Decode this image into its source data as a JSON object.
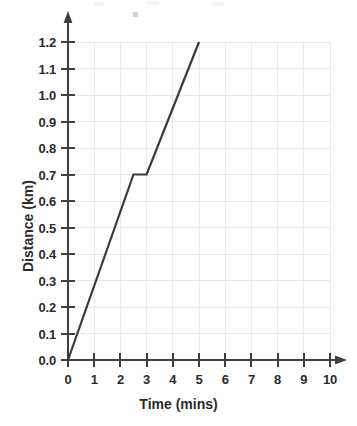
{
  "chart_data": {
    "type": "line",
    "title": "",
    "subtitle": "",
    "xlabel": "Time (mins)",
    "ylabel": "Distance (km)",
    "xlim": [
      0,
      10
    ],
    "ylim": [
      0.0,
      1.2
    ],
    "grid": true,
    "legend": "none",
    "x_ticks": [
      "0",
      "1",
      "2",
      "3",
      "4",
      "5",
      "6",
      "7",
      "8",
      "9",
      "10"
    ],
    "x_tick_values": [
      0,
      1,
      2,
      3,
      4,
      5,
      6,
      7,
      8,
      9,
      10
    ],
    "y_ticks": [
      "0.0",
      "0.1",
      "0.2",
      "0.3",
      "0.4",
      "0.5",
      "0.6",
      "0.7",
      "0.8",
      "0.9",
      "1.0",
      "1.1",
      "1.2"
    ],
    "y_tick_values": [
      0.0,
      0.1,
      0.2,
      0.3,
      0.4,
      0.5,
      0.6,
      0.7,
      0.8,
      0.9,
      1.0,
      1.1,
      1.2
    ],
    "series": [
      {
        "name": "Journey",
        "x": [
          0,
          2.5,
          3.0,
          5.0
        ],
        "values": [
          0.0,
          0.7,
          0.7,
          1.2
        ],
        "color": "#3a3a3a"
      }
    ],
    "annotations": [],
    "colors": {
      "line": "#3a3a3a",
      "axis": "#3f3f3f",
      "grid": "#e9e9ea",
      "text": "#2b2b2b",
      "background": "#ffffff"
    }
  }
}
